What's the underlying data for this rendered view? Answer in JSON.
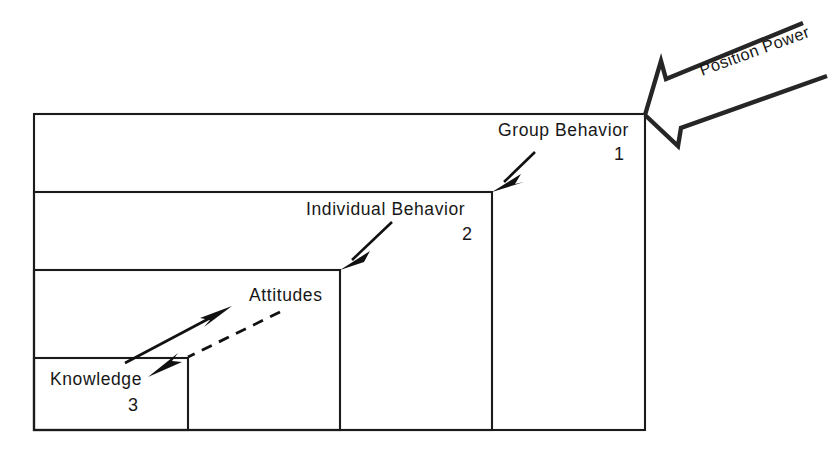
{
  "diagram": {
    "background_color": "#ffffff",
    "line_color": "#1b1b1b",
    "text_color": "#171717",
    "canvas": {
      "width": 831,
      "height": 454
    },
    "levels": [
      {
        "id": "group-behavior",
        "label": "Group Behavior",
        "number": "1",
        "rect": {
          "x": 34,
          "y": 114,
          "w": 611,
          "h": 316
        }
      },
      {
        "id": "individual-behavior",
        "label": "Individual Behavior",
        "number": "2",
        "rect": {
          "x": 34,
          "y": 192,
          "w": 458,
          "h": 238
        }
      },
      {
        "id": "attitudes",
        "label": "Attitudes",
        "number": "",
        "rect": {
          "x": 34,
          "y": 270,
          "w": 306,
          "h": 160
        }
      },
      {
        "id": "knowledge",
        "label": "Knowledge",
        "number": "3",
        "rect": {
          "x": 34,
          "y": 358,
          "w": 154,
          "h": 72
        }
      }
    ],
    "external_force": {
      "label": "Position Power",
      "style": "hollow-outline-arrow",
      "rotation_deg": -20,
      "points_to": "group-behavior-top-right-corner"
    },
    "connectors": [
      {
        "id": "arrow-to-group-behavior",
        "style": "solid",
        "direction": "down-left"
      },
      {
        "id": "arrow-to-individual-behavior",
        "style": "solid",
        "direction": "down-left"
      },
      {
        "id": "arrow-knowledge-to-attitudes",
        "style": "solid",
        "direction": "up-right"
      },
      {
        "id": "arrow-attitudes-to-knowledge",
        "style": "dashed",
        "direction": "down-left"
      }
    ]
  }
}
